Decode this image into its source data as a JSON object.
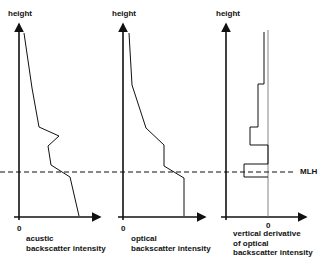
{
  "diagram": {
    "mlh_label": "MLH",
    "panels": [
      {
        "id": "acoustic",
        "y_label": "height",
        "zero_label": "0",
        "x_label_line1": "acustic",
        "x_label_line2": "backscatter intensity",
        "curve_type": "profile"
      },
      {
        "id": "optical",
        "y_label": "height",
        "zero_label": "0",
        "x_label_line1": "optical",
        "x_label_line2": "backscatter intensity",
        "curve_type": "profile"
      },
      {
        "id": "derivative",
        "y_label": "height",
        "zero_label": "0",
        "x_label_line1": "vertical derivative",
        "x_label_line2": "of optical",
        "x_label_line3": "backscatter intensity",
        "curve_type": "step"
      }
    ],
    "colors": {
      "line": "#111111",
      "zero_line": "#666666",
      "background": "#ffffff"
    }
  }
}
